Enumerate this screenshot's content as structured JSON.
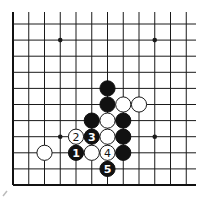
{
  "diagram": {
    "type": "go-board-fragment",
    "board_size": 19,
    "visible_columns": 12,
    "visible_rows": 11,
    "edges_shown": [
      "left",
      "bottom"
    ],
    "star_points": [
      {
        "col": 3,
        "row": 1
      },
      {
        "col": 9,
        "row": 1
      },
      {
        "col": 3,
        "row": 7
      },
      {
        "col": 9,
        "row": 7
      }
    ],
    "stones": [
      {
        "col": 6,
        "row": 4,
        "color": "black",
        "label": ""
      },
      {
        "col": 6,
        "row": 5,
        "color": "black",
        "label": ""
      },
      {
        "col": 7,
        "row": 5,
        "color": "white",
        "label": ""
      },
      {
        "col": 8,
        "row": 5,
        "color": "white",
        "label": ""
      },
      {
        "col": 5,
        "row": 6,
        "color": "black",
        "label": ""
      },
      {
        "col": 6,
        "row": 6,
        "color": "white",
        "label": ""
      },
      {
        "col": 7,
        "row": 6,
        "color": "black",
        "label": ""
      },
      {
        "col": 4,
        "row": 7,
        "color": "white",
        "label": "2"
      },
      {
        "col": 5,
        "row": 7,
        "color": "black",
        "label": "3"
      },
      {
        "col": 6,
        "row": 7,
        "color": "white",
        "label": ""
      },
      {
        "col": 7,
        "row": 7,
        "color": "black",
        "label": ""
      },
      {
        "col": 2,
        "row": 8,
        "color": "white",
        "label": ""
      },
      {
        "col": 4,
        "row": 8,
        "color": "black",
        "label": "1"
      },
      {
        "col": 5,
        "row": 8,
        "color": "white",
        "label": ""
      },
      {
        "col": 6,
        "row": 8,
        "color": "white",
        "label": "4"
      },
      {
        "col": 7,
        "row": 8,
        "color": "black",
        "label": ""
      },
      {
        "col": 6,
        "row": 9,
        "color": "black",
        "label": "5"
      }
    ],
    "colors": {
      "black": "#111111",
      "white": "#ffffff",
      "line": "#1a1a1a"
    }
  }
}
